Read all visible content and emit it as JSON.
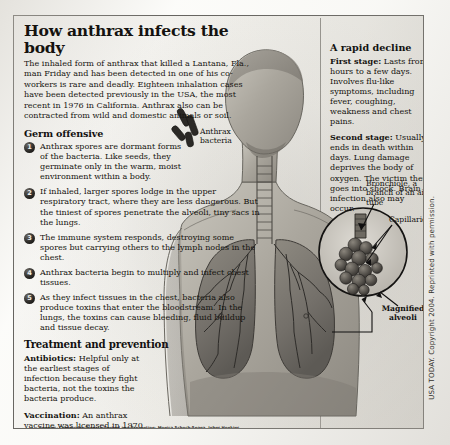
{
  "headline": "How anthrax infects the body",
  "deck": "The inhaled form of anthrax that killed a Lantana, Fla., man Friday and has been detected in one of his co-workers is rare and deadly. Eighteen inhalation cases have been detected previously in the USA, the most recent in 1976 in California. Anthrax also can be contracted from wild and domestic animals or soil.",
  "germ_offensive": {
    "heading": "Germ offensive",
    "steps": [
      {
        "number": "1",
        "text": "Anthrax spores are dormant forms of the bacteria.  Like seeds, they germinate only in the warm, moist environment within a body."
      },
      {
        "number": "2",
        "text": "If inhaled, larger spores lodge in the upper respiratory tract, where they are less dangerous. But the tiniest of spores penetrate the alveoli, tiny sacs in the lungs."
      },
      {
        "number": "3",
        "text": "The immune system responds, destroying some spores but carrying others to the lymph nodes in the chest."
      },
      {
        "number": "4",
        "text": "Anthrax bacteria begin to multiply and infect chest tissues."
      },
      {
        "number": "5",
        "text": "As they infect tissues in the chest, bacteria also produce toxins that enter the bloodstream. In the lungs, the toxins can cause bleeding, fluid buildup and tissue decay."
      }
    ]
  },
  "treatment": {
    "heading": "Treatment and prevention",
    "antibiotics_label": "Antibiotics:",
    "antibiotics_text": " Helpful only at the earliest stages of infection because they fight bacteria, not the toxins the bacteria produce.",
    "vaccination_label": "Vaccination:",
    "vaccination_text": " An anthrax vaccine was licensed in 1970 and is reserved for military use. Supplies are limited because of delays getting Federal Drug Administration approval for a new production facility in Lansing, Mich. The military plans to immunize more than 2 million servicemembers. So far, it has been given to about a half-million. Person-to-person spread of anthrax is extremely unlikely."
  },
  "rapid_decline": {
    "heading": "A rapid decline",
    "first_stage_label": "First stage:",
    "first_stage_text": " Lasts from hours to a few days. Involves flu-like symptoms, including fever, coughing, weakness and chest pains.",
    "second_stage_label": "Second stage:",
    "second_stage_text": " Usually ends in death within days. Lung damage deprives the body of oxygen. The victim then goes into shock. Brain infection also may occur."
  },
  "callouts": {
    "anthrax_bacteria": "Anthrax bacteria",
    "bronchiole": "Bronchiole, a branch of an air tube",
    "capillaries": "Capillaries",
    "magnified_alveoli": "Magnified alveoli"
  },
  "sources": "Sources: Centers for Disease Control and Prevention; Monica Schoch-Spana, Johns Hopkins University; Jeff Bender, University of Minnesota; AP",
  "copyright": "USA TODAY. Copyright 2004. Reprinted with permission.",
  "colors": {
    "ink": "#14120f",
    "paper": "#f3f2ee",
    "frame_border": "#4c4a46",
    "badge": "#1a1917"
  }
}
